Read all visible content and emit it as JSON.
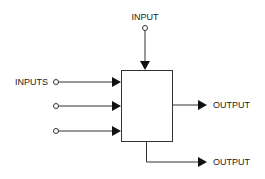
{
  "diagram": {
    "type": "block-diagram",
    "colors": {
      "line": "#333333",
      "arrow": "#111111",
      "text": "#222222",
      "background": "#ffffff"
    },
    "top_input": {
      "label": "INPUT"
    },
    "left_inputs": {
      "label": "INPUTS",
      "count": 3
    },
    "block": {
      "label": ""
    },
    "outputs": [
      {
        "label": "OUTPUT",
        "position": "right"
      },
      {
        "label": "OUTPUT",
        "position": "bottom"
      }
    ]
  }
}
